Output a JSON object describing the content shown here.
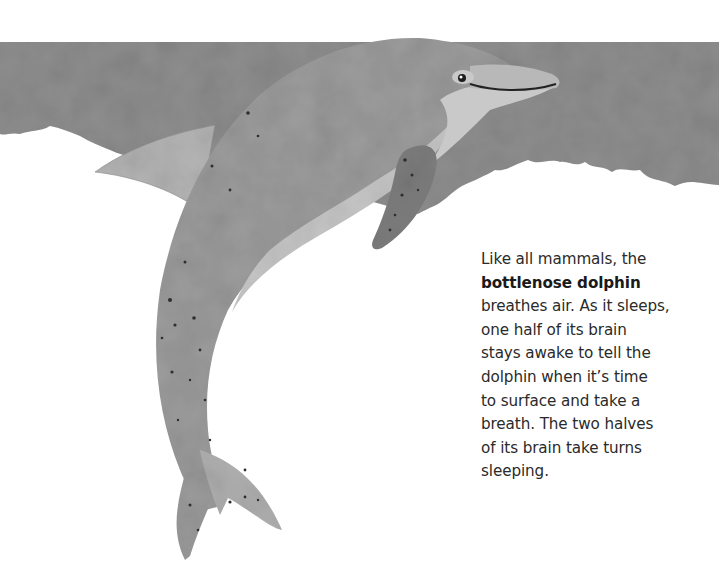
{
  "page": {
    "caption": {
      "lines": [
        "Like all mammals, the",
        "bottlenose dolphin",
        "breathes air. As it sleeps,",
        "one half of its brain",
        "stays awake to tell the",
        "dolphin when it’s time",
        "to surface and take a",
        "breath. The two halves",
        "of its brain take turns",
        "sleeping."
      ],
      "bold_term": "bottlenose dolphin"
    },
    "illustration": {
      "subject": "bottlenose-dolphin",
      "colors": {
        "water": "#8c8c8c",
        "body": "#9a9a9a",
        "belly": "#c4c4c4",
        "fin": "#7e7e7e",
        "speckle": "#333333",
        "background": "#ffffff"
      }
    }
  }
}
